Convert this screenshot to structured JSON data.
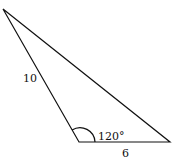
{
  "diagram": {
    "type": "triangle",
    "side_left_label": "10",
    "side_bottom_label": "6",
    "angle_label": "120°",
    "stroke_color": "#111111"
  }
}
